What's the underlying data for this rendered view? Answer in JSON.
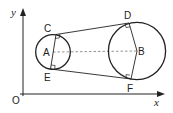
{
  "diagram": {
    "type": "geometry",
    "axes": {
      "x_label": "x",
      "y_label": "y",
      "origin_label": "O"
    },
    "points": {
      "A": "A",
      "B": "B",
      "C": "C",
      "D": "D",
      "E": "E",
      "F": "F"
    },
    "circles": [
      {
        "centre": "A",
        "size": "small"
      },
      {
        "centre": "B",
        "size": "large"
      }
    ],
    "segments": [
      {
        "from": "C",
        "to": "D",
        "style": "solid",
        "role": "tangent"
      },
      {
        "from": "E",
        "to": "F",
        "style": "solid",
        "role": "tangent"
      },
      {
        "from": "A",
        "to": "B",
        "style": "dashed",
        "role": "line of centres"
      },
      {
        "from": "C",
        "to": "E",
        "style": "solid",
        "role": "radii through A"
      },
      {
        "from": "D",
        "to": "F",
        "style": "solid",
        "role": "radii through B"
      }
    ],
    "right_angles": [
      "C",
      "E",
      "D",
      "F"
    ],
    "colors": {
      "stroke": "#222222",
      "dashed": "#888888",
      "background": "#ffffff"
    }
  }
}
